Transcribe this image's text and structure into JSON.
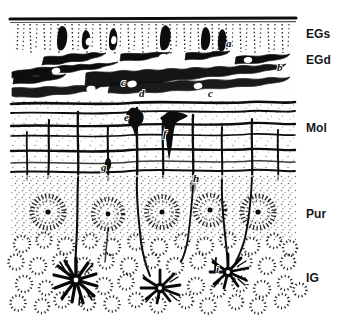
{
  "figure": {
    "kind": "histological-drawing",
    "width": 343,
    "height": 327,
    "background_color": "#ffffff",
    "ink_color": "#111111"
  },
  "layer_labels": [
    {
      "id": "egs",
      "text": "EGs",
      "x": 306,
      "y": 28,
      "layer_name": "external granular layer, superficial"
    },
    {
      "id": "egd",
      "text": "EGd",
      "x": 306,
      "y": 54,
      "layer_name": "external granular layer, deep"
    },
    {
      "id": "mol",
      "text": "Mol",
      "x": 306,
      "y": 122,
      "layer_name": "molecular layer"
    },
    {
      "id": "pur",
      "text": "Pur",
      "x": 306,
      "y": 208,
      "layer_name": "Purkinje cell layer"
    },
    {
      "id": "ig",
      "text": "IG",
      "x": 306,
      "y": 272,
      "layer_name": "internal granular layer"
    }
  ],
  "item_markers": [
    {
      "id": "a",
      "text": "a",
      "x": 226,
      "y": 38
    },
    {
      "id": "b",
      "text": "b",
      "x": 277,
      "y": 62
    },
    {
      "id": "c1",
      "text": "c",
      "x": 121,
      "y": 77
    },
    {
      "id": "d",
      "text": "d",
      "x": 139,
      "y": 88
    },
    {
      "id": "c2",
      "text": "c",
      "x": 208,
      "y": 88
    },
    {
      "id": "e",
      "text": "e",
      "x": 124,
      "y": 112
    },
    {
      "id": "f",
      "text": "f",
      "x": 163,
      "y": 128
    },
    {
      "id": "g",
      "text": "g",
      "x": 101,
      "y": 162
    },
    {
      "id": "h",
      "text": "h",
      "x": 193,
      "y": 173
    },
    {
      "id": "i",
      "text": "i",
      "x": 216,
      "y": 264
    }
  ],
  "bands": {
    "egs": {
      "top": 16,
      "bottom": 56,
      "description": "superficial external granular zone, dotted vertical streaks with dark fusiform cells"
    },
    "egd": {
      "top": 56,
      "bottom": 100,
      "description": "deep external granular zone, horizontal dark fibres with bipolar cells"
    },
    "mol": {
      "top": 100,
      "bottom": 175,
      "description": "molecular layer, horizontal fibre bands crossed by vertical Bergmann fibres"
    },
    "pur": {
      "top": 175,
      "bottom": 240,
      "description": "Purkinje cell layer, stippled somata in a row"
    },
    "ig": {
      "top": 240,
      "bottom": 312,
      "description": "internal granular layer, dotted circles and dark astrocytes"
    }
  },
  "purkinje_cells": [
    {
      "cx": 48,
      "cy": 212
    },
    {
      "cx": 108,
      "cy": 212
    },
    {
      "cx": 162,
      "cy": 212
    },
    {
      "cx": 210,
      "cy": 210
    },
    {
      "cx": 258,
      "cy": 212
    }
  ],
  "astrocytes": [
    {
      "cx": 76,
      "cy": 280,
      "size": "large"
    },
    {
      "cx": 160,
      "cy": 288,
      "size": "medium"
    },
    {
      "cx": 228,
      "cy": 272,
      "size": "medium"
    }
  ]
}
